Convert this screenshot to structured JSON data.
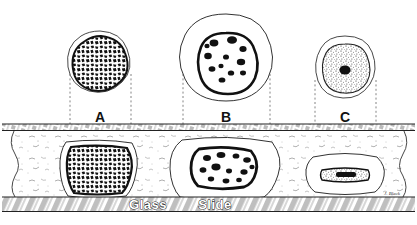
{
  "figure": {
    "ink_color": "#1a1a1a",
    "background_color": "#ffffff",
    "fill_color": "#ffffff"
  },
  "labels": {
    "a": "A",
    "b": "B",
    "c": "C",
    "glass": "Glass",
    "slide": "Slide",
    "signature": "J. Black"
  },
  "cells": [
    {
      "id": "a",
      "label": "A",
      "nucleus_pattern": "coarse-clumped-chromatin",
      "free_center": [
        100,
        63
      ],
      "free_radius": 31,
      "squashed_center": [
        100,
        168
      ],
      "squashed_rx": 36,
      "squashed_ry": 29
    },
    {
      "id": "b",
      "label": "B",
      "nucleus_pattern": "discrete-dark-granules",
      "free_center": [
        226,
        58
      ],
      "free_radius": 44,
      "squashed_center": [
        226,
        168
      ],
      "squashed_rx": 48,
      "squashed_ry": 32
    },
    {
      "id": "c",
      "label": "C",
      "nucleus_pattern": "fine-stipple-with-nucleolus",
      "free_center": [
        345,
        66
      ],
      "free_radius": 30,
      "squashed_center": [
        345,
        172
      ],
      "squashed_rx": 34,
      "squashed_ry": 24
    }
  ],
  "structures": {
    "coverslip_label": "coverslip",
    "coverslip_y": 124,
    "coverslip_height": 6,
    "medium_label": "mounting-medium",
    "slide_label": "glass-slide",
    "slide_y": 197,
    "slide_height": 15
  },
  "projection_lines": {
    "style": "dotted",
    "count": 6
  }
}
